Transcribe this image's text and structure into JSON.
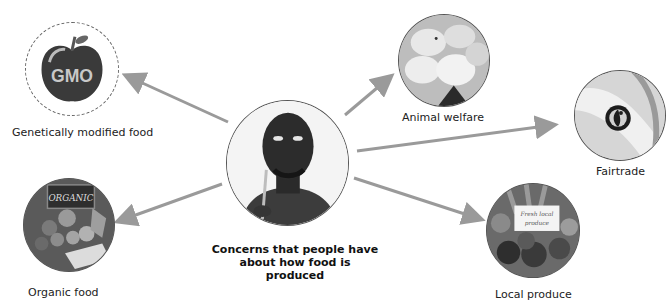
{
  "diagram": {
    "center": {
      "image": "thinking-man-photo",
      "caption_line1": "Concerns that people have",
      "caption_line2": "about how food is produced"
    },
    "nodes": [
      {
        "id": "gmo",
        "label": "Genetically modified food",
        "image": "gmo-apple-icon",
        "badge_text": "GMO"
      },
      {
        "id": "organic",
        "label": "Organic food",
        "image": "organic-vegetables-photo",
        "sign_text": "ORGANIC"
      },
      {
        "id": "animal",
        "label": "Animal welfare",
        "image": "chicks-photo"
      },
      {
        "id": "fairtrade",
        "label": "Fairtrade",
        "image": "fairtrade-logo-banana-photo"
      },
      {
        "id": "local",
        "label": "Local produce",
        "image": "local-produce-photo",
        "sign_text": "Fresh local produce"
      }
    ],
    "arrow_color": "#9a9a9a"
  }
}
